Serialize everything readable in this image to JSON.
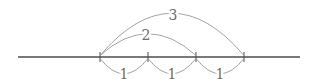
{
  "figure": {
    "width": 320,
    "height": 83,
    "colors": {
      "background": "#ffffff",
      "line": "#4d4d4d",
      "tick": "#4d4d4d",
      "arc": "#9a9a9a",
      "label": "#6e6e6e"
    },
    "number_line": {
      "x1": 18,
      "x2": 300,
      "y": 57,
      "stroke_width": 1.4
    },
    "ticks": [
      {
        "x": 100
      },
      {
        "x": 148
      },
      {
        "x": 196
      },
      {
        "x": 244
      }
    ],
    "tick_half_height": 5,
    "arcs": [
      {
        "name": "unit-arc-1",
        "side": "below",
        "x_from": 100,
        "x_to": 148,
        "end_y": 58.5,
        "control_y": 89,
        "label": "1",
        "label_x": 124,
        "label_y": 79
      },
      {
        "name": "unit-arc-2",
        "side": "below",
        "x_from": 148,
        "x_to": 196,
        "end_y": 58.5,
        "control_y": 89,
        "label": "1",
        "label_x": 172,
        "label_y": 79
      },
      {
        "name": "unit-arc-3",
        "side": "below",
        "x_from": 196,
        "x_to": 244,
        "end_y": 58.5,
        "control_y": 89,
        "label": "1",
        "label_x": 220,
        "label_y": 79
      },
      {
        "name": "span-arc-2",
        "side": "above",
        "x_from": 100,
        "x_to": 196,
        "end_y": 55.5,
        "control_y": 12,
        "label": "2",
        "label_x": 146,
        "label_y": 39.5
      },
      {
        "name": "span-arc-3",
        "side": "above",
        "x_from": 100,
        "x_to": 244,
        "end_y": 55.5,
        "control_y": -29,
        "label": "3",
        "label_x": 173,
        "label_y": 19.5
      }
    ],
    "arc_stroke_width": 0.9,
    "tick_stroke_width": 1
  }
}
